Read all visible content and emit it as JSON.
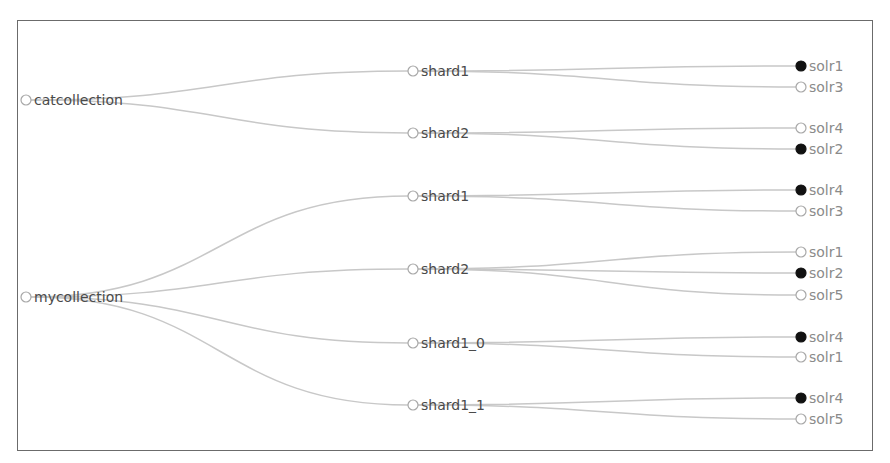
{
  "graph": {
    "type": "tree",
    "collections": [
      {
        "name": "catcollection",
        "x": 26,
        "y": 100,
        "shards": [
          {
            "name": "shard1",
            "x": 413,
            "y": 71,
            "replicas": [
              {
                "name": "solr1",
                "active": true,
                "y": 66
              },
              {
                "name": "solr3",
                "active": false,
                "y": 87
              }
            ]
          },
          {
            "name": "shard2",
            "x": 413,
            "y": 133,
            "replicas": [
              {
                "name": "solr4",
                "active": false,
                "y": 128
              },
              {
                "name": "solr2",
                "active": true,
                "y": 149
              }
            ]
          }
        ]
      },
      {
        "name": "mycollection",
        "x": 26,
        "y": 297,
        "shards": [
          {
            "name": "shard1",
            "x": 413,
            "y": 196,
            "replicas": [
              {
                "name": "solr4",
                "active": true,
                "y": 190
              },
              {
                "name": "solr3",
                "active": false,
                "y": 211
              }
            ]
          },
          {
            "name": "shard2",
            "x": 413,
            "y": 269,
            "replicas": [
              {
                "name": "solr1",
                "active": false,
                "y": 252
              },
              {
                "name": "solr2",
                "active": true,
                "y": 273
              },
              {
                "name": "solr5",
                "active": false,
                "y": 295
              }
            ]
          },
          {
            "name": "shard1_0",
            "x": 413,
            "y": 343,
            "replicas": [
              {
                "name": "solr4",
                "active": true,
                "y": 337
              },
              {
                "name": "solr1",
                "active": false,
                "y": 357
              }
            ]
          },
          {
            "name": "shard1_1",
            "x": 413,
            "y": 405,
            "replicas": [
              {
                "name": "solr4",
                "active": true,
                "y": 398
              },
              {
                "name": "solr5",
                "active": false,
                "y": 419
              }
            ]
          }
        ]
      }
    ],
    "leaf_x": 801,
    "colors": {
      "link": "#c8c8c8",
      "active_node": "#111111",
      "inactive_node_stroke": "#a8a8a8",
      "inner_label": "#4a4a4a",
      "leaf_label": "#8a8a8a",
      "border": "#6b6b6b"
    }
  }
}
